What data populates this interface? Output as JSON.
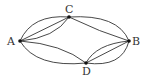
{
  "diagram": {
    "type": "multigraph",
    "nodes": [
      {
        "id": "A",
        "label": "A",
        "x": 20,
        "y": 41,
        "lx": 7,
        "ly": 45
      },
      {
        "id": "C",
        "label": "C",
        "x": 69,
        "y": 17,
        "lx": 65,
        "ly": 13
      },
      {
        "id": "B",
        "label": "B",
        "x": 129,
        "y": 41,
        "lx": 132,
        "ly": 45
      },
      {
        "id": "D",
        "label": "D",
        "x": 86,
        "y": 63,
        "lx": 82,
        "ly": 75
      }
    ],
    "edges": [
      {
        "from": "A",
        "to": "C",
        "count": 3
      },
      {
        "from": "C",
        "to": "B",
        "count": 2
      },
      {
        "from": "A",
        "to": "D",
        "count": 2
      },
      {
        "from": "D",
        "to": "B",
        "count": 3
      }
    ],
    "colors": {
      "stroke": "#333333",
      "node": "#111111",
      "background": "#ffffff"
    }
  }
}
